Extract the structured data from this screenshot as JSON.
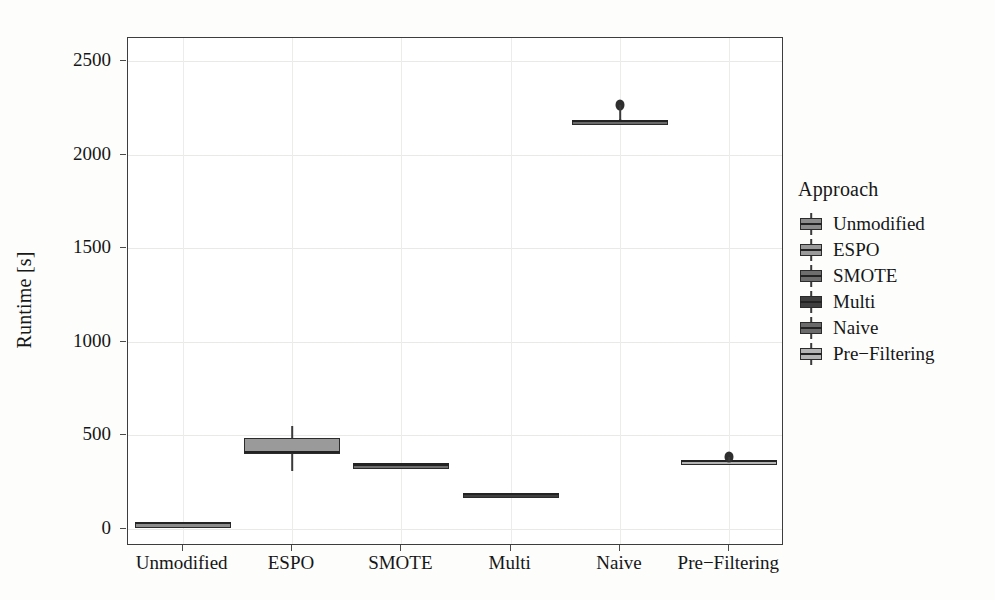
{
  "chart_data": {
    "type": "box",
    "title": "",
    "xlabel": "",
    "ylabel": "Runtime [s]",
    "ylim": [
      -90,
      2670
    ],
    "yticks": [
      0,
      500,
      1000,
      1500,
      2000,
      2500
    ],
    "ytick_labels": [
      "0",
      "500",
      "1000",
      "1500",
      "2000",
      "2500"
    ],
    "categories": [
      "Unmodified",
      "ESPO",
      "SMOTE",
      "Multi",
      "Naive",
      "Pre−Filtering"
    ],
    "grid": "major-horizontal-and-vertical-faint",
    "legend_position": "right",
    "legend_title": "Approach",
    "boxes": [
      {
        "name": "Unmodified",
        "whisker_low": 28,
        "q1": 30,
        "median": 31,
        "q3": 32,
        "whisker_high": 34,
        "outliers": [],
        "fill": "#8c8c8c"
      },
      {
        "name": "ESPO",
        "whisker_low": 310,
        "q1": 400,
        "median": 412,
        "q3": 485,
        "whisker_high": 550,
        "outliers": [],
        "fill": "#9a9a9a"
      },
      {
        "name": "SMOTE",
        "whisker_low": 340,
        "q1": 343,
        "median": 345,
        "q3": 347,
        "whisker_high": 350,
        "outliers": [],
        "fill": "#6e6e6e"
      },
      {
        "name": "Multi",
        "whisker_low": 182,
        "q1": 184,
        "median": 185,
        "q3": 187,
        "whisker_high": 189,
        "outliers": [],
        "fill": "#3f3f3f"
      },
      {
        "name": "Naive",
        "whisker_low": 2172,
        "q1": 2176,
        "median": 2180,
        "q3": 2184,
        "whisker_high": 2188,
        "outliers": [
          2265
        ],
        "fill": "#6a6a6a"
      },
      {
        "name": "Pre−Filtering",
        "whisker_low": 358,
        "q1": 361,
        "median": 363,
        "q3": 365,
        "whisker_high": 368,
        "outliers": [
          385
        ],
        "fill": "#b4b4b4"
      }
    ],
    "legend_entries": [
      {
        "label": "Unmodified",
        "fill": "#8c8c8c"
      },
      {
        "label": "ESPO",
        "fill": "#9a9a9a"
      },
      {
        "label": "SMOTE",
        "fill": "#6e6e6e"
      },
      {
        "label": "Multi",
        "fill": "#3f3f3f"
      },
      {
        "label": "Naive",
        "fill": "#6a6a6a"
      },
      {
        "label": "Pre−Filtering",
        "fill": "#b4b4b4"
      }
    ]
  },
  "axes": {
    "y_title": "Runtime [s]"
  },
  "legend": {
    "title": "Approach"
  }
}
